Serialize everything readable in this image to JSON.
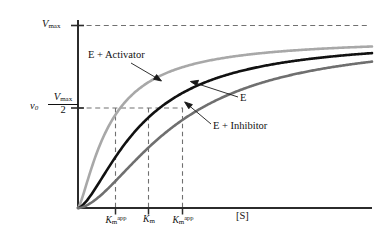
{
  "chart_data": {
    "type": "line",
    "title": "",
    "xlabel": "[S]",
    "ylabel": "v0",
    "xlim": [
      0,
      10
    ],
    "ylim": [
      0,
      1
    ],
    "grid": false,
    "legend_position": "inline-annotations",
    "axis_labels": {
      "y_top": "Vmax",
      "y_half_numerator": "Vmax",
      "y_half_denominator": "2",
      "y_rate": "v0",
      "x_axis": "[S]"
    },
    "y_ticks": [
      {
        "label": "Vmax",
        "value": 1.0
      },
      {
        "label": "Vmax/2",
        "value": 0.5
      }
    ],
    "x_ticks": [
      {
        "label": "Km-app",
        "value": 1.1,
        "belongs_to": "E + Activator"
      },
      {
        "label": "Km",
        "value": 2.2,
        "belongs_to": "E"
      },
      {
        "label": "Km-app",
        "value": 3.4,
        "belongs_to": "E + Inhibitor"
      }
    ],
    "series": [
      {
        "name": "E + Activator",
        "color": "#a8a8a8",
        "km": 1.1,
        "vmax": 0.93,
        "hill": 1.35,
        "annotation": "E + Activator"
      },
      {
        "name": "E",
        "color": "#111111",
        "km": 2.2,
        "vmax": 0.93,
        "hill": 1.55,
        "annotation": "E"
      },
      {
        "name": "E + Inhibitor",
        "color": "#6f6f6f",
        "km": 3.4,
        "vmax": 0.93,
        "hill": 1.7,
        "annotation": "E + Inhibitor"
      }
    ],
    "reference_lines": [
      {
        "name": "vmax-asymptote",
        "orientation": "horizontal",
        "value": 1.0,
        "style": "dashed"
      },
      {
        "name": "half-max",
        "orientation": "horizontal",
        "value": 0.5,
        "style": "dashed"
      },
      {
        "name": "km-activator",
        "orientation": "vertical",
        "value": 1.1,
        "style": "dashed"
      },
      {
        "name": "km-enzyme",
        "orientation": "vertical",
        "value": 2.2,
        "style": "dashed"
      },
      {
        "name": "km-inhibitor",
        "orientation": "vertical",
        "value": 3.4,
        "style": "dashed"
      }
    ]
  },
  "labels": {
    "vmax": "V",
    "vmax_sub": "max",
    "v0": "v",
    "v0_sub": "0",
    "half_numerator": "V",
    "half_numerator_sub": "max",
    "half_denominator": "2",
    "activator": "E + Activator",
    "enzyme": "E",
    "inhibitor": "E + Inhibitor",
    "km_letter": "K",
    "km_sub": "m",
    "km_sup": "app",
    "x_axis": "[S]"
  },
  "colors": {
    "activator": "#a8a8a8",
    "enzyme": "#111111",
    "inhibitor": "#6f6f6f",
    "axis": "#333333",
    "dashed": "#777777",
    "background": "#ffffff"
  }
}
